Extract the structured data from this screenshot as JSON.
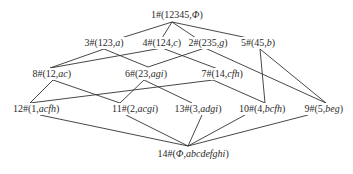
{
  "diagram": {
    "type": "concept-lattice",
    "nodes": [
      {
        "id": "1",
        "prefix": "1#(",
        "extent": "12345",
        "sep": ",",
        "intent": "Φ",
        "suffix": ")",
        "x": 177,
        "y": 15
      },
      {
        "id": "3",
        "prefix": "3#(",
        "extent": "123",
        "sep": ",",
        "intent": "a",
        "suffix": ")",
        "x": 104,
        "y": 43
      },
      {
        "id": "4",
        "prefix": "4#(",
        "extent": "124",
        "sep": ",",
        "intent": "c",
        "suffix": ")",
        "x": 162,
        "y": 43
      },
      {
        "id": "2",
        "prefix": "2#(",
        "extent": "235",
        "sep": ",",
        "intent": "g",
        "suffix": ")",
        "x": 208,
        "y": 43
      },
      {
        "id": "5",
        "prefix": "5#(",
        "extent": "45",
        "sep": ",",
        "intent": "b",
        "suffix": ")",
        "x": 258,
        "y": 43
      },
      {
        "id": "8",
        "prefix": "8#(",
        "extent": "12",
        "sep": ",",
        "intent": "ac",
        "suffix": ")",
        "x": 52,
        "y": 74
      },
      {
        "id": "6",
        "prefix": "6#(",
        "extent": "23",
        "sep": ",",
        "intent": "agi",
        "suffix": ")",
        "x": 146,
        "y": 74
      },
      {
        "id": "7",
        "prefix": "7#(",
        "extent": "14",
        "sep": ",",
        "intent": "cfh",
        "suffix": ")",
        "x": 222,
        "y": 74
      },
      {
        "id": "12",
        "prefix": "12#(",
        "extent": "1",
        "sep": ",",
        "intent": "acfh",
        "suffix": ")",
        "x": 36,
        "y": 109
      },
      {
        "id": "11",
        "prefix": "11#(",
        "extent": "2",
        "sep": ",",
        "intent": "acgi",
        "suffix": ")",
        "x": 135,
        "y": 109
      },
      {
        "id": "13",
        "prefix": "13#(",
        "extent": "3",
        "sep": ",",
        "intent": "adgi",
        "suffix": ")",
        "x": 198,
        "y": 109
      },
      {
        "id": "10",
        "prefix": "10#(",
        "extent": "4",
        "sep": ",",
        "intent": "bcfh",
        "suffix": ")",
        "x": 262,
        "y": 109
      },
      {
        "id": "9",
        "prefix": "9#(",
        "extent": "5",
        "sep": ",",
        "intent": "beg",
        "suffix": ")",
        "x": 324,
        "y": 109
      },
      {
        "id": "14",
        "prefix": "14#(",
        "extent": "Φ",
        "sep": ",",
        "intent": "abcdefghi",
        "suffix": ")",
        "x": 193,
        "y": 154
      }
    ],
    "edges": [
      {
        "from": "1",
        "to": "3",
        "x1": 172,
        "y1": 22,
        "x2": 118,
        "y2": 39
      },
      {
        "from": "1",
        "to": "4",
        "x1": 172,
        "y1": 22,
        "x2": 162,
        "y2": 38
      },
      {
        "from": "1",
        "to": "2",
        "x1": 172,
        "y1": 22,
        "x2": 196,
        "y2": 38
      },
      {
        "from": "1",
        "to": "5",
        "x1": 172,
        "y1": 22,
        "x2": 248,
        "y2": 38
      },
      {
        "from": "3",
        "to": "8",
        "x1": 104,
        "y1": 49,
        "x2": 50,
        "y2": 68
      },
      {
        "from": "3",
        "to": "6",
        "x1": 104,
        "y1": 49,
        "x2": 148,
        "y2": 67
      },
      {
        "from": "4",
        "to": "8",
        "x1": 162,
        "y1": 48,
        "x2": 50,
        "y2": 68
      },
      {
        "from": "4",
        "to": "7",
        "x1": 162,
        "y1": 48,
        "x2": 218,
        "y2": 69
      },
      {
        "from": "2",
        "to": "6",
        "x1": 205,
        "y1": 48,
        "x2": 148,
        "y2": 67
      },
      {
        "from": "2",
        "to": "9",
        "x1": 205,
        "y1": 48,
        "x2": 326,
        "y2": 103
      },
      {
        "from": "5",
        "to": "10",
        "x1": 260,
        "y1": 49,
        "x2": 265,
        "y2": 103
      },
      {
        "from": "5",
        "to": "9",
        "x1": 260,
        "y1": 49,
        "x2": 326,
        "y2": 103
      },
      {
        "from": "8",
        "to": "12",
        "x1": 53,
        "y1": 80,
        "x2": 30,
        "y2": 103
      },
      {
        "from": "8",
        "to": "11",
        "x1": 53,
        "y1": 80,
        "x2": 120,
        "y2": 103
      },
      {
        "from": "6",
        "to": "11",
        "x1": 144,
        "y1": 80,
        "x2": 120,
        "y2": 103
      },
      {
        "from": "6",
        "to": "13",
        "x1": 144,
        "y1": 80,
        "x2": 192,
        "y2": 103
      },
      {
        "from": "7",
        "to": "12",
        "x1": 213,
        "y1": 80,
        "x2": 30,
        "y2": 103
      },
      {
        "from": "7",
        "to": "10",
        "x1": 213,
        "y1": 80,
        "x2": 265,
        "y2": 103
      },
      {
        "from": "12",
        "to": "14",
        "x1": 40,
        "y1": 115,
        "x2": 188,
        "y2": 146
      },
      {
        "from": "11",
        "to": "14",
        "x1": 126,
        "y1": 115,
        "x2": 188,
        "y2": 146
      },
      {
        "from": "13",
        "to": "14",
        "x1": 202,
        "y1": 115,
        "x2": 188,
        "y2": 146
      },
      {
        "from": "10",
        "to": "14",
        "x1": 245,
        "y1": 115,
        "x2": 188,
        "y2": 146
      },
      {
        "from": "9",
        "to": "14",
        "x1": 308,
        "y1": 115,
        "x2": 188,
        "y2": 146
      }
    ]
  },
  "colors": {
    "line": "#333333",
    "text": "#2a2a2a",
    "background": "#ffffff"
  }
}
